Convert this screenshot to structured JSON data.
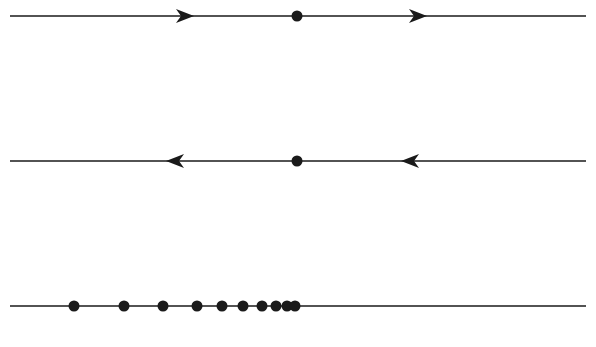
{
  "diagram": {
    "line_color": "#1a1a1a",
    "lines": [
      {
        "name": "flow-line-outward",
        "y": 16,
        "x1": 10,
        "x2": 586,
        "fixed_point": {
          "x": 297
        },
        "arrows": [
          {
            "x": 185,
            "dir": "right"
          },
          {
            "x": 418,
            "dir": "right"
          }
        ]
      },
      {
        "name": "flow-line-inward",
        "y": 161,
        "x1": 10,
        "x2": 586,
        "fixed_point": {
          "x": 297
        },
        "arrows": [
          {
            "x": 175,
            "dir": "left"
          },
          {
            "x": 410,
            "dir": "left"
          }
        ]
      },
      {
        "name": "sequence-line",
        "y": 306,
        "x1": 10,
        "x2": 586,
        "points": [
          74,
          124,
          163,
          197,
          222,
          243,
          262,
          276,
          287,
          295
        ]
      }
    ],
    "caption": "(cut off at bottom)"
  }
}
